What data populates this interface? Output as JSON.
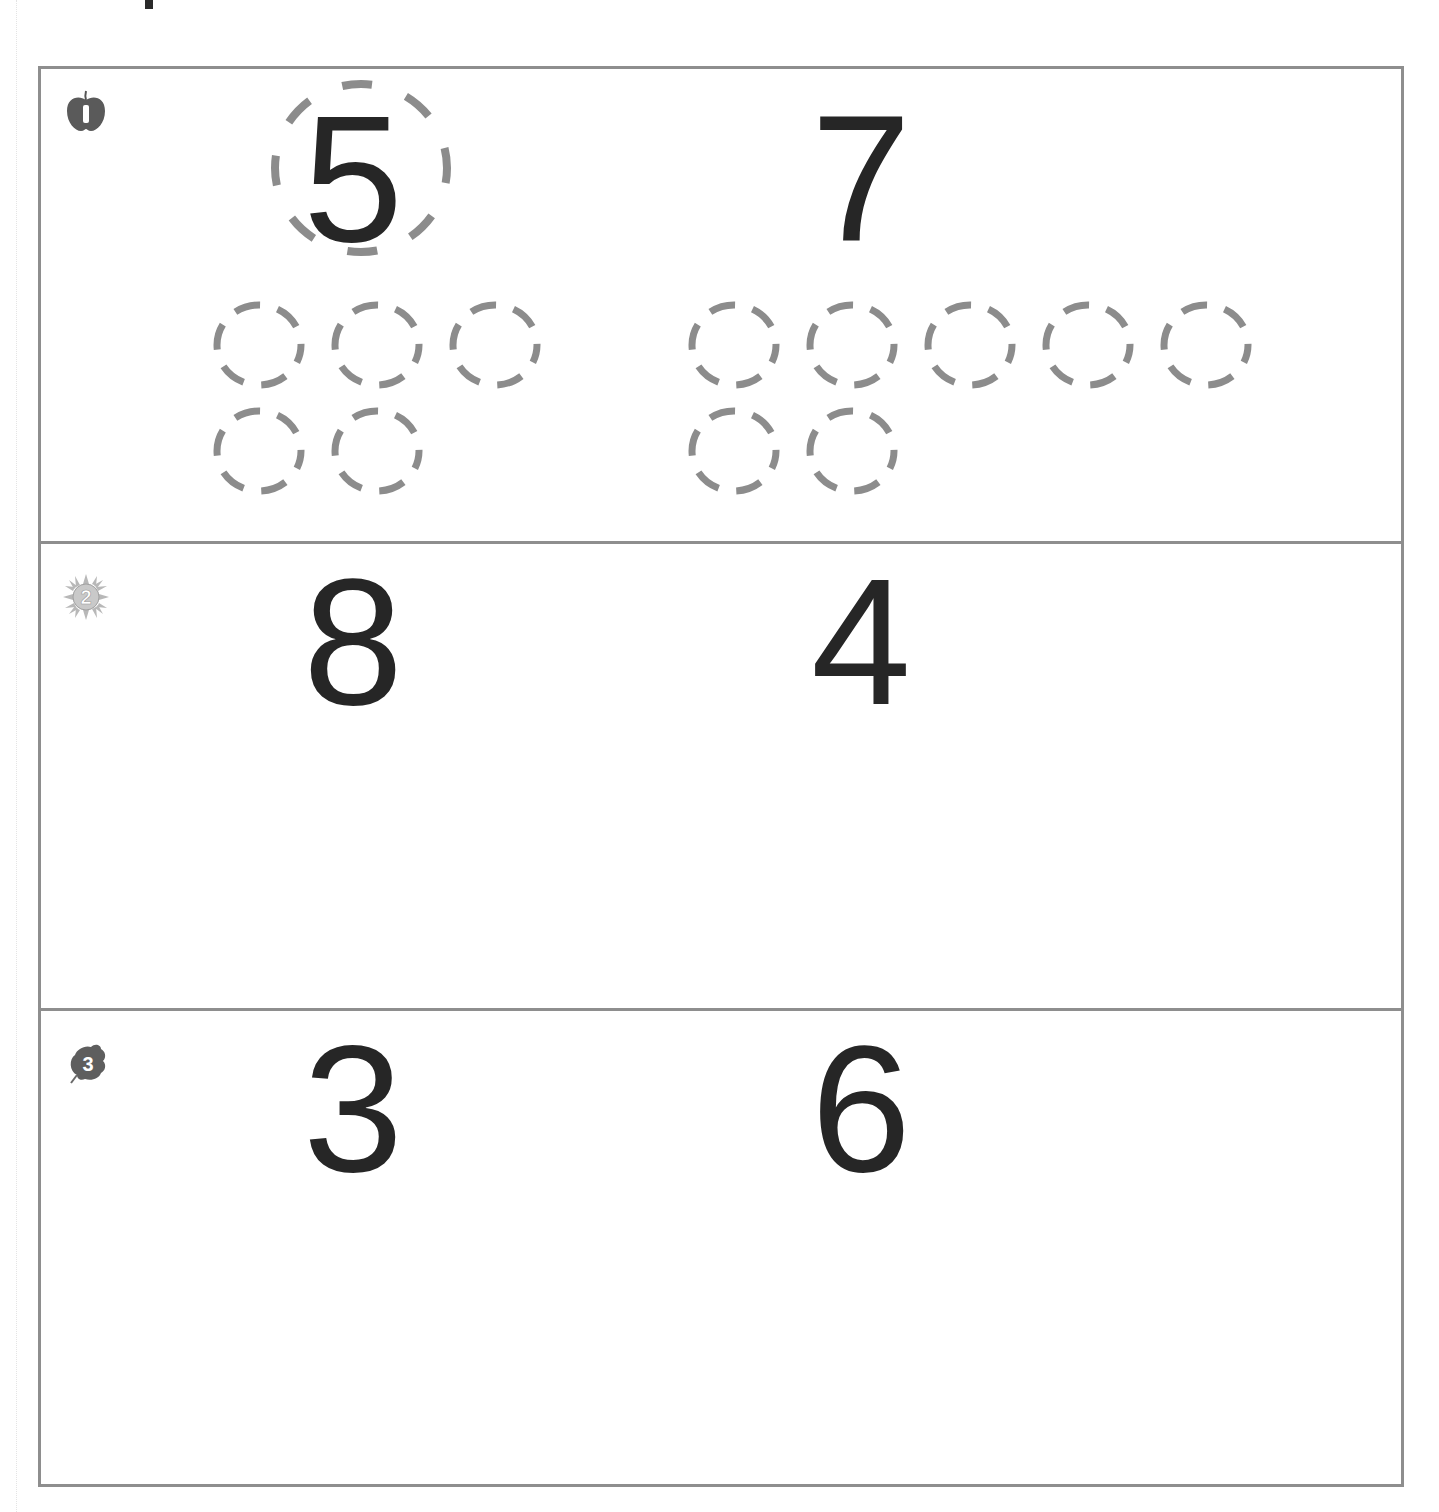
{
  "worksheet": {
    "sections": [
      {
        "index": 1,
        "badge": {
          "label": "1",
          "icon": "apple-badge-icon"
        },
        "left": {
          "number": "5",
          "circled": true,
          "counter_rows": [
            3,
            2
          ],
          "counter_total": 5
        },
        "right": {
          "number": "7",
          "circled": false,
          "counter_rows": [
            5,
            2
          ],
          "counter_total": 7
        }
      },
      {
        "index": 2,
        "badge": {
          "label": "2",
          "icon": "sun-badge-icon"
        },
        "left": {
          "number": "8"
        },
        "right": {
          "number": "4"
        }
      },
      {
        "index": 3,
        "badge": {
          "label": "3",
          "icon": "leaf-badge-icon"
        },
        "left": {
          "number": "3"
        },
        "right": {
          "number": "6"
        }
      }
    ],
    "colors": {
      "frame": "#8e8e8e",
      "dash": "#8c8c8c",
      "numeral": "#262626"
    }
  }
}
